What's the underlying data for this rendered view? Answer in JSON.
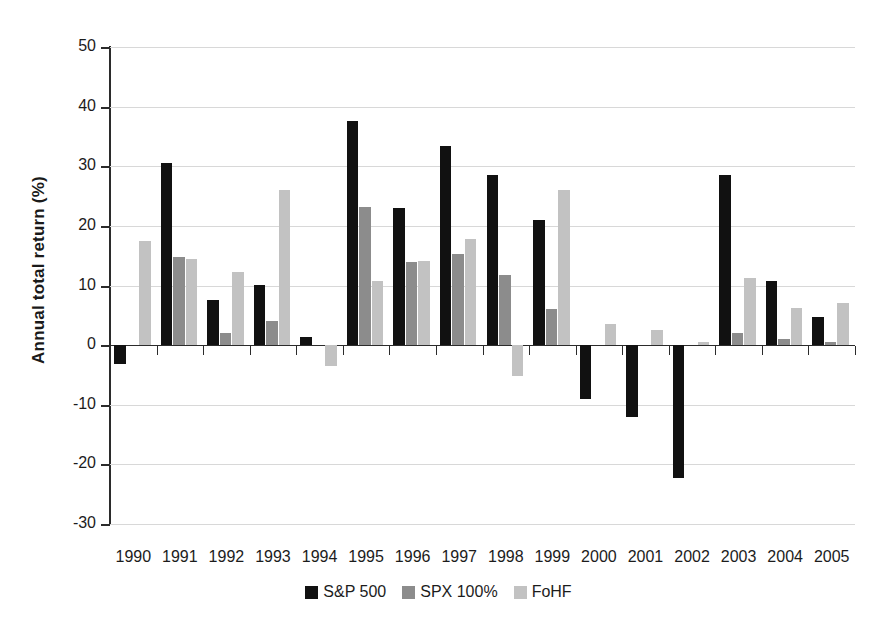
{
  "chart_data": {
    "type": "bar",
    "title": "",
    "subtitle": "",
    "xlabel": "",
    "ylabel": "Annual total return (%)",
    "ylim": [
      -30,
      50
    ],
    "ytick_step": 10,
    "yticks": [
      50,
      40,
      30,
      20,
      10,
      0,
      -10,
      -20,
      -30
    ],
    "ytick_labels": [
      "50",
      "40",
      "30",
      "20",
      "10",
      "0",
      "-10",
      "-20",
      "-30"
    ],
    "grid": true,
    "grid_axis": "y",
    "legend_position": "bottom",
    "categories": [
      "1990",
      "1991",
      "1992",
      "1993",
      "1994",
      "1995",
      "1996",
      "1997",
      "1998",
      "1999",
      "2000",
      "2001",
      "2002",
      "2003",
      "2004",
      "2005"
    ],
    "series": [
      {
        "name": "S&P 500",
        "color": "#111111",
        "values": [
          -3.1,
          30.5,
          7.6,
          10.1,
          1.3,
          37.6,
          23.0,
          33.4,
          28.6,
          21.0,
          -9.1,
          -12.0,
          -22.3,
          28.5,
          10.8,
          4.8
        ]
      },
      {
        "name": "SPX 100%",
        "color": "#8c8c8c",
        "values": [
          null,
          14.8,
          2.0,
          4.0,
          null,
          23.1,
          13.9,
          15.2,
          11.7,
          6.0,
          null,
          null,
          null,
          2.0,
          1.0,
          0.5
        ]
      },
      {
        "name": "FoHF",
        "color": "#c2c2c2",
        "values": [
          17.4,
          14.5,
          12.2,
          26.1,
          -3.5,
          10.7,
          14.1,
          17.8,
          -5.1,
          26.0,
          3.6,
          2.5,
          0.6,
          11.3,
          6.3,
          7.0
        ]
      }
    ]
  },
  "legend": {
    "items": [
      {
        "label": "S&P 500",
        "color": "#111111"
      },
      {
        "label": "SPX 100%",
        "color": "#8c8c8c"
      },
      {
        "label": "FoHF",
        "color": "#c2c2c2"
      }
    ]
  },
  "axes": {
    "y_title": "Annual total return (%)"
  }
}
